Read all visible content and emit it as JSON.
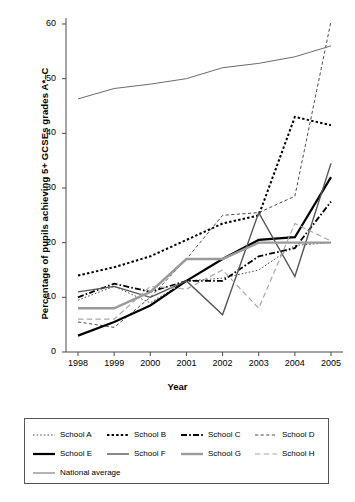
{
  "chart_data": {
    "type": "line",
    "title": "",
    "xlabel": "Year",
    "ylabel": "Percentage of pupils achieving 5+ GCSEs grades A*–C",
    "x": [
      1998,
      1999,
      2000,
      2001,
      2002,
      2003,
      2004,
      2005
    ],
    "xtick_labels": [
      "1998",
      "1999",
      "2000",
      "2001",
      "2002",
      "2003",
      "2004",
      "2005"
    ],
    "ytick_labels": [
      "0",
      "10",
      "20",
      "30",
      "40",
      "50",
      "60"
    ],
    "ylim": [
      0,
      60
    ],
    "xlim": [
      1998,
      2005
    ],
    "grid": false,
    "legend_position": "below",
    "series": [
      {
        "name": "School A",
        "style": "fine-dotted",
        "color": "#4d4d4d",
        "width": 1.0,
        "values": [
          9.5,
          12.0,
          9.0,
          13.0,
          13.5,
          15.0,
          19.5,
          20.0
        ]
      },
      {
        "name": "School B",
        "style": "bold-dotted",
        "color": "#000000",
        "width": 2.0,
        "values": [
          14.0,
          15.5,
          17.5,
          20.5,
          23.5,
          25.0,
          43.0,
          41.5
        ]
      },
      {
        "name": "School C",
        "style": "dash-dot",
        "color": "#000000",
        "width": 1.8,
        "values": [
          10.0,
          12.5,
          11.0,
          13.0,
          13.0,
          17.5,
          19.0,
          27.5
        ]
      },
      {
        "name": "School D",
        "style": "fine-dashed",
        "color": "#4d4d4d",
        "width": 1.0,
        "values": [
          5.5,
          4.5,
          10.0,
          17.0,
          25.0,
          25.5,
          28.5,
          60.5
        ]
      },
      {
        "name": "School E",
        "style": "solid-bold",
        "color": "#000000",
        "width": 2.2,
        "values": [
          3.0,
          5.5,
          8.5,
          13.0,
          17.0,
          20.5,
          21.0,
          32.0
        ]
      },
      {
        "name": "School F",
        "style": "solid-medium",
        "color": "#555555",
        "width": 1.4,
        "values": [
          11.0,
          12.0,
          10.0,
          13.0,
          6.8,
          25.5,
          13.8,
          34.5
        ]
      },
      {
        "name": "School G",
        "style": "solid-grey",
        "color": "#9a9a9a",
        "width": 2.4,
        "values": [
          8.0,
          8.0,
          11.0,
          17.0,
          17.0,
          20.0,
          20.0,
          20.0
        ]
      },
      {
        "name": "School H",
        "style": "long-dash-grey",
        "color": "#a8a8a8",
        "width": 1.2,
        "values": [
          6.0,
          6.0,
          12.0,
          11.5,
          15.0,
          8.0,
          23.5,
          20.3
        ]
      },
      {
        "name": "National average",
        "style": "solid-thin",
        "color": "#6b6b6b",
        "width": 1.0,
        "values": [
          46.3,
          48.2,
          49.0,
          50.0,
          52.0,
          52.8,
          54.0,
          56.0
        ]
      }
    ]
  },
  "axis": {
    "ylabel": "Percentage of pupils achieving 5+ GCSEs grades A*–C",
    "xlabel": "Year"
  },
  "legend": {
    "rows": [
      [
        {
          "label": "School A",
          "style": "fine-dotted"
        },
        {
          "label": "School B",
          "style": "bold-dotted"
        },
        {
          "label": "School C",
          "style": "dash-dot"
        },
        {
          "label": "School D",
          "style": "fine-dashed"
        }
      ],
      [
        {
          "label": "School E",
          "style": "solid-bold"
        },
        {
          "label": "School F",
          "style": "solid-medium"
        },
        {
          "label": "School G",
          "style": "solid-grey"
        },
        {
          "label": "School H",
          "style": "long-dash-grey"
        }
      ],
      [
        {
          "label": "National average",
          "style": "solid-thin"
        }
      ]
    ]
  }
}
